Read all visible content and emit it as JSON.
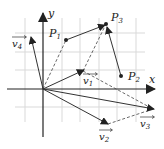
{
  "diagram": {
    "axes": {
      "x_label": "x",
      "y_label": "y"
    },
    "points": [
      {
        "name": "P1",
        "label_main": "P",
        "label_sub": "1"
      },
      {
        "name": "P2",
        "label_main": "P",
        "label_sub": "2"
      },
      {
        "name": "P3",
        "label_main": "P",
        "label_sub": "3"
      }
    ],
    "vectors": [
      {
        "name": "v1",
        "label_main": "v",
        "label_sub": "1"
      },
      {
        "name": "v2",
        "label_main": "v",
        "label_sub": "2"
      },
      {
        "name": "v3",
        "label_main": "v",
        "label_sub": "3"
      },
      {
        "name": "v4",
        "label_main": "v",
        "label_sub": "4"
      }
    ],
    "colors": {
      "grid": "#d9d9d9",
      "stroke": "#333333",
      "background": "#ffffff"
    }
  }
}
